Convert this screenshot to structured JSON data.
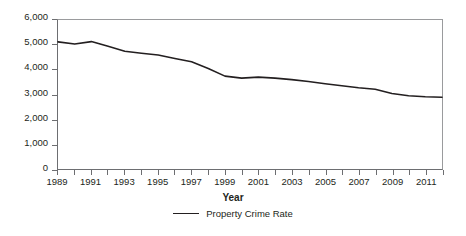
{
  "chart_data": {
    "type": "line",
    "title": "",
    "xlabel": "Year",
    "ylabel": "",
    "xlim": [
      1989,
      2012
    ],
    "ylim": [
      0,
      6000
    ],
    "grid": false,
    "legend_position": "bottom-center",
    "y_ticks": [
      "6,000",
      "5,000",
      "4,000",
      "3,000",
      "2,000",
      "1,000",
      "0"
    ],
    "y_tick_values": [
      6000,
      5000,
      4000,
      3000,
      2000,
      1000,
      0
    ],
    "x_tick_values": [
      1989,
      1990,
      1991,
      1992,
      1993,
      1994,
      1995,
      1996,
      1997,
      1998,
      1999,
      2000,
      2001,
      2002,
      2003,
      2004,
      2005,
      2006,
      2007,
      2008,
      2009,
      2010,
      2011,
      2012
    ],
    "x_tick_labels": [
      "1989",
      "",
      "1991",
      "",
      "1993",
      "",
      "1995",
      "",
      "1997",
      "",
      "1999",
      "",
      "2001",
      "",
      "2003",
      "",
      "2005",
      "",
      "2007",
      "",
      "2009",
      "",
      "2011",
      ""
    ],
    "x": [
      1989,
      1990,
      1991,
      1992,
      1993,
      1994,
      1995,
      1996,
      1997,
      1998,
      1999,
      2000,
      2001,
      2002,
      2003,
      2004,
      2005,
      2006,
      2007,
      2008,
      2009,
      2010,
      2011,
      2012
    ],
    "series": [
      {
        "name": "Property Crime Rate",
        "color": "#231f20",
        "values": [
          5120,
          5030,
          5130,
          4940,
          4740,
          4660,
          4590,
          4450,
          4320,
          4050,
          3740,
          3660,
          3700,
          3660,
          3600,
          3520,
          3430,
          3350,
          3270,
          3210,
          3040,
          2950,
          2910,
          2890
        ]
      }
    ],
    "legend": [
      {
        "label": "Property Crime Rate",
        "color": "#231f20"
      }
    ],
    "colors": {
      "series_line": "#231f20",
      "axis": "#6d6e71",
      "frame": "#9a9b9d",
      "text": "#231f20",
      "background": "#ffffff"
    }
  }
}
